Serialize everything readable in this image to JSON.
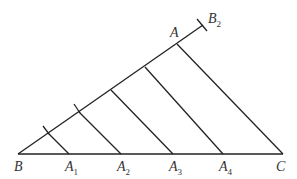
{
  "diagram": {
    "labels": {
      "B": "B",
      "C": "C",
      "A": "A",
      "B2": "B",
      "B2_sub": "2",
      "A1": "A",
      "A1_sub": "1",
      "A2": "A",
      "A2_sub": "2",
      "A3": "A",
      "A3_sub": "3",
      "A4": "A",
      "A4_sub": "4"
    },
    "line_color": "#222222"
  }
}
